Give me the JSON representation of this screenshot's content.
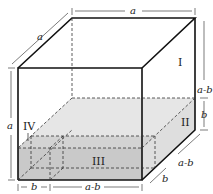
{
  "diagram": {
    "regions": [
      {
        "id": "I",
        "label": "I"
      },
      {
        "id": "II",
        "label": "II"
      },
      {
        "id": "III",
        "label": "III"
      },
      {
        "id": "IV",
        "label": "IV"
      }
    ],
    "dimensions": {
      "top_edge": "a",
      "depth_edge": "a",
      "front_height": "a",
      "right_upper": "a-b",
      "right_lower": "b",
      "depth_lower": "a-b",
      "depth_small": "b",
      "bottom_left": "b",
      "bottom_right": "a-b"
    },
    "colors": {
      "stroke": "#111111",
      "shade_light": "#e4e4e4",
      "shade_dark": "#c4c4c4"
    }
  }
}
